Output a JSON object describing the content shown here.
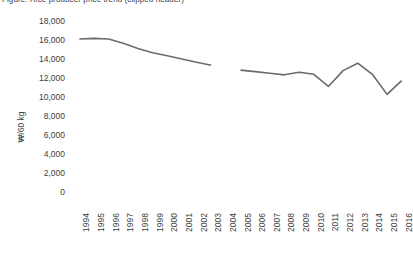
{
  "title": {
    "text": "Figure: Rice producer price trend (clipped header)",
    "visible_fragment": ""
  },
  "axis": {
    "y_title": "₩/60 kg",
    "y_ticks": [
      "18,000",
      "16,000",
      "14,000",
      "12,000",
      "10,000",
      "8,000",
      "6,000",
      "4,000",
      "2,000",
      "0"
    ],
    "x_ticks": [
      "1994",
      "1995",
      "1996",
      "1997",
      "1998",
      "1999",
      "2000",
      "2001",
      "2002",
      "2003",
      "2004",
      "2005",
      "2006",
      "2007",
      "2008",
      "2009",
      "2010",
      "2011",
      "2012",
      "2013",
      "2014",
      "2015",
      "2016"
    ]
  },
  "style": {
    "line_color": "#6b6b6b",
    "text_color": "#3d3d3d",
    "background": "#ffffff",
    "line_width": 1.6
  },
  "chart_data": {
    "type": "line",
    "title": "",
    "xlabel": "",
    "ylabel": "₩/60 kg",
    "ylim": [
      0,
      18000
    ],
    "ytick_interval": 2000,
    "grid": false,
    "legend": false,
    "x": [
      1994,
      1995,
      1996,
      1997,
      1998,
      1999,
      2000,
      2001,
      2002,
      2003,
      2004,
      2005,
      2006,
      2007,
      2008,
      2009,
      2010,
      2011,
      2012,
      2013,
      2014,
      2015,
      2016
    ],
    "series": [
      {
        "name": "Rice price",
        "values": [
          16300,
          16350,
          16300,
          15900,
          15400,
          15000,
          14700,
          14400,
          14100,
          13800,
          null,
          13350,
          13200,
          13050,
          12900,
          13150,
          12950,
          11800,
          13300,
          14000,
          12950,
          11050,
          12350
        ]
      }
    ]
  }
}
